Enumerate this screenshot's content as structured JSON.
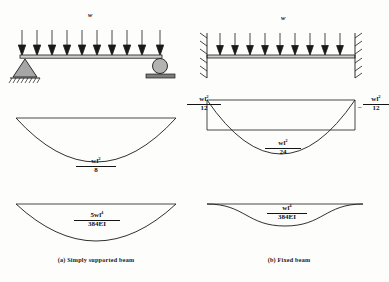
{
  "figure": {
    "load_symbol": "w",
    "stroke_color": "#1a1a1a",
    "fill_gray": "#9a9a9a"
  },
  "columns": [
    {
      "id": "simply-supported",
      "caption": "(a) Simply supported beam",
      "load_label": "w",
      "supports": {
        "left": "pin-support",
        "right": "roller-support"
      },
      "bmd": {
        "midspan": {
          "numerator": "wl",
          "numerator_exp": "2",
          "denominator": "8",
          "sign": ""
        }
      },
      "deflection": {
        "midspan": {
          "numerator": "5wl",
          "numerator_exp": "4",
          "denominator": "384EI",
          "sign": ""
        }
      }
    },
    {
      "id": "fixed",
      "caption": "(b) Fixed beam",
      "load_label": "w",
      "supports": {
        "left": "fixed-support",
        "right": "fixed-support"
      },
      "bmd": {
        "left_support": {
          "numerator": "wl",
          "numerator_exp": "2",
          "denominator": "12",
          "sign": "–"
        },
        "right_support": {
          "numerator": "wl",
          "numerator_exp": "2",
          "denominator": "12",
          "sign": "–"
        },
        "midspan": {
          "numerator": "wl",
          "numerator_exp": "2",
          "denominator": "24",
          "sign": ""
        }
      },
      "deflection": {
        "midspan": {
          "numerator": "wl",
          "numerator_exp": "4",
          "denominator": "384EI",
          "sign": ""
        }
      }
    }
  ]
}
